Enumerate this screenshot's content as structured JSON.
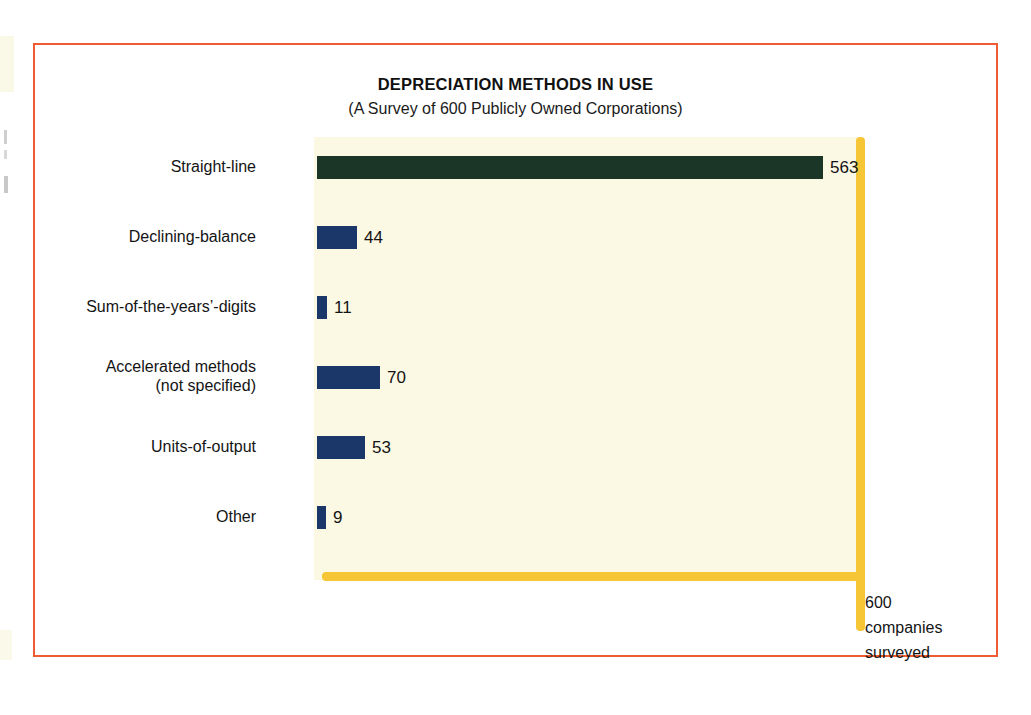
{
  "figure": {
    "frame_color": "#ef5c33",
    "plot_background": "#fbf8e4",
    "axis_color": "#f7c636"
  },
  "chart_data": {
    "type": "bar",
    "orientation": "horizontal",
    "title": "DEPRECIATION METHODS IN USE",
    "subtitle": "(A Survey of 600 Publicly Owned Corporations)",
    "xlabel": "",
    "ylabel": "",
    "xlim": [
      0,
      600
    ],
    "grid": false,
    "legend": false,
    "axis_note": [
      "600",
      "companies",
      "surveyed"
    ],
    "axis_note_text": "600 companies surveyed",
    "categories": [
      "Straight-line",
      "Declining-balance",
      "Sum-of-the-years'-digits",
      "Accelerated methods (not specified)",
      "Units-of-output",
      "Other"
    ],
    "values": [
      563,
      44,
      11,
      70,
      53,
      9
    ],
    "bars": [
      {
        "label": "Straight-line",
        "label_line1": "Straight-line",
        "label_line2": "",
        "value": 563,
        "value_text": "563",
        "color": "#1b3527"
      },
      {
        "label": "Declining-balance",
        "label_line1": "Declining-balance",
        "label_line2": "",
        "value": 44,
        "value_text": "44",
        "color": "#1b3668"
      },
      {
        "label": "Sum-of-the-years'-digits",
        "label_line1": "Sum-of-the-years’-digits",
        "label_line2": "",
        "value": 11,
        "value_text": "11",
        "color": "#1b3668"
      },
      {
        "label": "Accelerated methods (not specified)",
        "label_line1": "Accelerated methods",
        "label_line2": "(not specified)",
        "value": 70,
        "value_text": "70",
        "color": "#1b3668"
      },
      {
        "label": "Units-of-output",
        "label_line1": "Units-of-output",
        "label_line2": "",
        "value": 53,
        "value_text": "53",
        "color": "#1b3668"
      },
      {
        "label": "Other",
        "label_line1": "Other",
        "label_line2": "",
        "value": 9,
        "value_text": "9",
        "color": "#1b3668"
      }
    ]
  }
}
